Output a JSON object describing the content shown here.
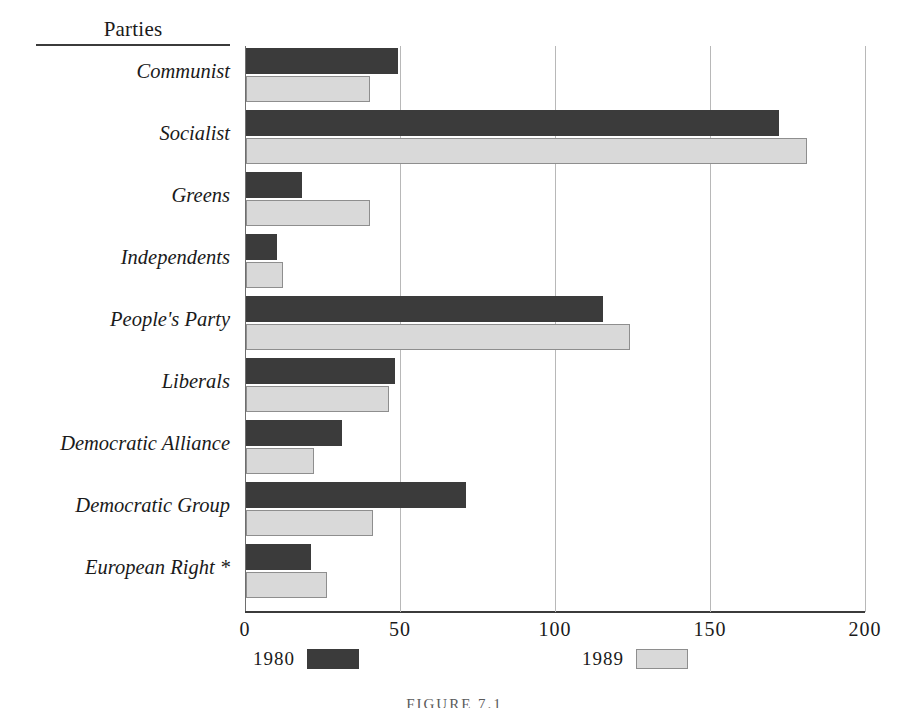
{
  "header": {
    "column_title": "Parties"
  },
  "caption": "FIGURE 7.1",
  "axis": {
    "xticks": [
      "0",
      "50",
      "100",
      "150",
      "200"
    ],
    "xtick_values": [
      0,
      50,
      100,
      150,
      200
    ],
    "xmin": 0,
    "xmax": 200
  },
  "legend": {
    "entries": [
      {
        "label": "1980",
        "swatch": "dark",
        "color": "#3b3b3b"
      },
      {
        "label": "1989",
        "swatch": "light",
        "color": "#d9d9d9"
      }
    ]
  },
  "rows": [
    {
      "label": "Communist",
      "v1980": 49,
      "v1989": 40
    },
    {
      "label": "Socialist",
      "v1980": 172,
      "v1989": 181
    },
    {
      "label": "Greens",
      "v1980": 18,
      "v1989": 40
    },
    {
      "label": "Independents",
      "v1980": 10,
      "v1989": 12
    },
    {
      "label": "People's Party",
      "v1980": 115,
      "v1989": 124
    },
    {
      "label": "Liberals",
      "v1980": 48,
      "v1989": 46
    },
    {
      "label": "Democratic Alliance",
      "v1980": 31,
      "v1989": 22
    },
    {
      "label": "Democratic Group",
      "v1980": 71,
      "v1989": 41
    },
    {
      "label": "European Right *",
      "v1980": 21,
      "v1989": 26
    }
  ],
  "chart_data": {
    "type": "bar",
    "orientation": "horizontal",
    "title": "",
    "subtitle": "",
    "xlabel": "",
    "ylabel": "Parties",
    "xlim": [
      0,
      200
    ],
    "xticks": [
      0,
      50,
      100,
      150,
      200
    ],
    "grid": "vertical",
    "legend_position": "bottom",
    "categories": [
      "Communist",
      "Socialist",
      "Greens",
      "Independents",
      "People's Party",
      "Liberals",
      "Democratic Alliance",
      "Democratic Group",
      "European Right *"
    ],
    "series": [
      {
        "name": "1980",
        "color": "#3b3b3b",
        "values": [
          49,
          172,
          18,
          10,
          115,
          48,
          31,
          71,
          21
        ]
      },
      {
        "name": "1989",
        "color": "#d9d9d9",
        "values": [
          40,
          181,
          40,
          12,
          124,
          46,
          22,
          41,
          26
        ]
      }
    ],
    "annotations": [
      "* European Right"
    ],
    "caption": "FIGURE 7.1"
  }
}
